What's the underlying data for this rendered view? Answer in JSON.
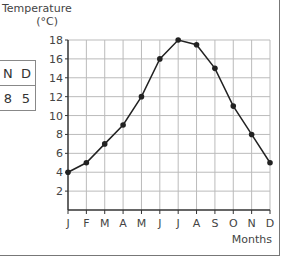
{
  "chart_data": {
    "type": "line",
    "title": "",
    "ylabel": "Temperature (°C)",
    "ylabel_line1": "Temperature",
    "ylabel_line2": "(°C)",
    "xlabel": "Months",
    "categories": [
      "J",
      "F",
      "M",
      "A",
      "M",
      "J",
      "J",
      "A",
      "S",
      "O",
      "N",
      "D"
    ],
    "values": [
      4,
      5,
      7,
      9,
      12,
      16,
      18,
      17.5,
      15,
      11,
      8,
      5
    ],
    "yticks": [
      2,
      4,
      6,
      8,
      10,
      12,
      14,
      16,
      18
    ],
    "ylim": [
      0,
      18
    ],
    "grid": true,
    "line_color": "#222222",
    "grid_color": "#bbbbbb"
  },
  "side_table": {
    "headers": [
      "N",
      "D"
    ],
    "values": [
      "8",
      "5"
    ]
  }
}
